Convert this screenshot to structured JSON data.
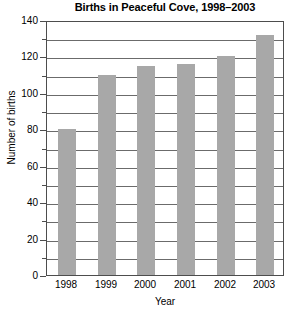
{
  "chart_data": {
    "type": "bar",
    "title": "Births in Peaceful Cove, 1998–2003",
    "xlabel": "Year",
    "ylabel": "Number of births",
    "categories": [
      "1998",
      "1999",
      "2000",
      "2001",
      "2002",
      "2003"
    ],
    "values": [
      80,
      110,
      115,
      116,
      120,
      132
    ],
    "ylim": [
      0,
      140
    ],
    "ytick_labels": [
      "0",
      "20",
      "40",
      "60",
      "80",
      "100",
      "120",
      "140"
    ],
    "ytick_values": [
      0,
      20,
      40,
      60,
      80,
      100,
      120,
      140
    ],
    "yminor_values": [
      10,
      30,
      50,
      70,
      90,
      110,
      130
    ],
    "gridline_values": [
      10,
      20,
      30,
      40,
      50,
      60,
      70,
      80,
      90,
      100,
      110,
      120,
      130
    ],
    "grid": true,
    "legend": "none",
    "bar_color": "#a8a8a8",
    "axis_color": "#4d4d4d",
    "grid_color": "#6b6b6b",
    "background": "#ffffff"
  }
}
